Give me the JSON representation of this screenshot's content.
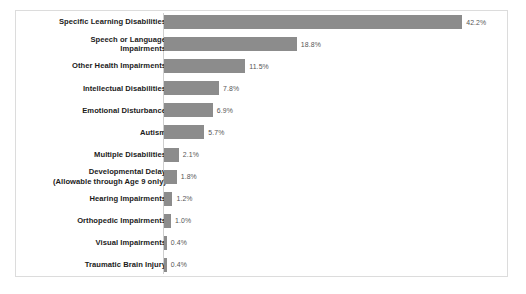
{
  "chart_data": {
    "type": "bar",
    "orientation": "horizontal",
    "title": "",
    "subtitle": "",
    "xlabel": "",
    "ylabel": "",
    "grid": false,
    "legend": null,
    "axis_range": [
      0,
      45
    ],
    "value_suffix": "%",
    "bar_color": "#8c8c8c",
    "label_color": "#1b1b1b",
    "value_label_color": "#555555",
    "border_color": "#dcdcdc",
    "categories": [
      "Specific Learning Disabilities",
      "Speech or Language\nImpairments",
      "Other Health Impairments",
      "Intellectual Disabilities",
      "Emotional Disturbance",
      "Autism",
      "Multiple Disabilities",
      "Developmental Delay\n(Allowable through Age 9 only)",
      "Hearing Impairments",
      "Orthopedic Impairments",
      "Visual Impairments",
      "Traumatic Brain Injury"
    ],
    "values": [
      42.2,
      18.8,
      11.5,
      7.8,
      6.9,
      5.7,
      2.1,
      1.8,
      1.2,
      1.0,
      0.4,
      0.4
    ],
    "value_labels": [
      "42.2%",
      "18.8%",
      "11.5%",
      "7.8%",
      "6.9%",
      "5.7%",
      "2.1%",
      "1.8%",
      "1.2%",
      "1.0%",
      "0.4%",
      "0.4%"
    ]
  }
}
